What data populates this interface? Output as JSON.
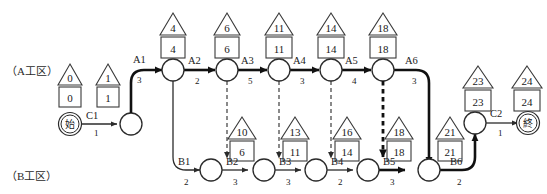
{
  "diagram": {
    "zones": [
      {
        "id": "zone-a",
        "label": "（A工区）"
      },
      {
        "id": "zone-b",
        "label": "（B工区）"
      }
    ],
    "terminals": {
      "start": {
        "label": "始",
        "triangle": "0",
        "square": "0"
      },
      "end": {
        "label": "終",
        "triangle": "24",
        "square": "24"
      }
    },
    "markers": [
      {
        "id": "m-start",
        "triangle": "0",
        "square": "0"
      },
      {
        "id": "m-c1-end",
        "triangle": "1",
        "square": "1"
      },
      {
        "id": "m-a1",
        "triangle": "4",
        "square": "4"
      },
      {
        "id": "m-a2",
        "triangle": "6",
        "square": "6"
      },
      {
        "id": "m-a3",
        "triangle": "11",
        "square": "11"
      },
      {
        "id": "m-a4",
        "triangle": "14",
        "square": "14"
      },
      {
        "id": "m-a5",
        "triangle": "18",
        "square": "18"
      },
      {
        "id": "m-b2",
        "triangle": "10",
        "square": "6"
      },
      {
        "id": "m-b3",
        "triangle": "13",
        "square": "11"
      },
      {
        "id": "m-b4",
        "triangle": "16",
        "square": "14"
      },
      {
        "id": "m-b5",
        "triangle": "18",
        "square": "18"
      },
      {
        "id": "m-b6",
        "triangle": "21",
        "square": "21"
      },
      {
        "id": "m-c2",
        "triangle": "23",
        "square": "23"
      },
      {
        "id": "m-end",
        "triangle": "24",
        "square": "24"
      }
    ],
    "activities": [
      {
        "id": "act-c1",
        "name": "C1",
        "duration": "1"
      },
      {
        "id": "act-a1",
        "name": "A1",
        "duration": "3"
      },
      {
        "id": "act-a2",
        "name": "A2",
        "duration": "2"
      },
      {
        "id": "act-a3",
        "name": "A3",
        "duration": "5"
      },
      {
        "id": "act-a4",
        "name": "A4",
        "duration": "3"
      },
      {
        "id": "act-a5",
        "name": "A5",
        "duration": "4"
      },
      {
        "id": "act-a6",
        "name": "A6",
        "duration": "3"
      },
      {
        "id": "act-b1",
        "name": "B1",
        "duration": "2"
      },
      {
        "id": "act-b2",
        "name": "B2",
        "duration": "3"
      },
      {
        "id": "act-b3",
        "name": "B3",
        "duration": "3"
      },
      {
        "id": "act-b4",
        "name": "B4",
        "duration": "2"
      },
      {
        "id": "act-b5",
        "name": "B5",
        "duration": "3"
      },
      {
        "id": "act-b6",
        "name": "B6",
        "duration": "2"
      },
      {
        "id": "act-c2",
        "name": "C2",
        "duration": "1"
      }
    ]
  }
}
